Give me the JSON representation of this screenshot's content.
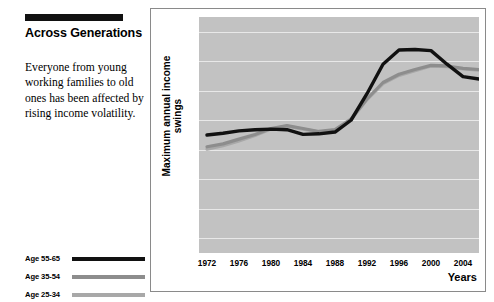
{
  "article": {
    "headline": "Across Generations",
    "deck": "Everyone from young working families to old ones has been affected by rising income volatility."
  },
  "legend": {
    "position": "left-panel-bottom",
    "items": [
      {
        "label": "Age 55-65",
        "color": "#111111"
      },
      {
        "label": "Age 35-54",
        "color": "#8d8d8d"
      },
      {
        "label": "Age 25-34",
        "color": "#a8a8a8"
      }
    ]
  },
  "chart_data": {
    "type": "line",
    "title": "",
    "xlabel": "Years",
    "ylabel": "Maximum annual income swings",
    "grid": true,
    "plot_background": "#c2c2c2",
    "x": [
      1972,
      1974,
      1976,
      1978,
      1980,
      1982,
      1984,
      1986,
      1988,
      1990,
      1992,
      1994,
      1996,
      1998,
      2000,
      2002,
      2004,
      2006
    ],
    "xlim": [
      1971,
      2006
    ],
    "xticks": [
      "1972",
      "1976",
      "1980",
      "1984",
      "1988",
      "1992",
      "1996",
      "2000",
      "2004"
    ],
    "xtick_values": [
      1972,
      1976,
      1980,
      1984,
      1988,
      1992,
      1996,
      2000,
      2004
    ],
    "ylim": [
      2.5,
      42.5
    ],
    "yticks": [
      "5%",
      "10%",
      "15%",
      "20%",
      "25%",
      "30%",
      "35%",
      "40%"
    ],
    "ytick_values": [
      5,
      10,
      15,
      20,
      25,
      30,
      35,
      40
    ],
    "series": [
      {
        "name": "Age 55-65",
        "color": "#111111",
        "width": 3.4,
        "values": [
          22.5,
          22.8,
          23.2,
          23.4,
          23.5,
          23.4,
          22.6,
          22.7,
          23.0,
          25.0,
          29.5,
          34.5,
          36.9,
          37.0,
          36.8,
          34.5,
          32.4,
          32.0
        ]
      },
      {
        "name": "Age 35-54",
        "color": "#8d8d8d",
        "width": 3.2,
        "values": [
          20.5,
          21.0,
          21.8,
          22.6,
          23.6,
          24.1,
          23.6,
          23.1,
          23.4,
          25.2,
          28.6,
          31.4,
          32.8,
          33.6,
          34.3,
          34.2,
          33.8,
          33.6
        ]
      },
      {
        "name": "Age 25-34",
        "color": "#a8a8a8",
        "width": 3.2,
        "values": [
          20.1,
          20.7,
          21.5,
          22.4,
          23.5,
          24.0,
          23.5,
          23.0,
          23.3,
          25.1,
          28.5,
          31.2,
          32.6,
          33.4,
          34.2,
          34.1,
          33.7,
          33.5
        ]
      }
    ]
  }
}
